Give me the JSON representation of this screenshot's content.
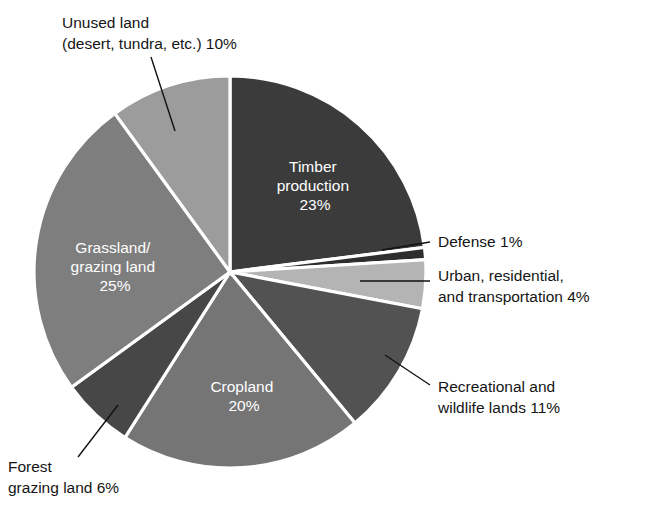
{
  "chart_data": {
    "type": "pie",
    "title": "",
    "subtitle": "",
    "xlabel": "",
    "ylabel": "",
    "legend_position": "none",
    "grid": false,
    "start_angle_deg": 0,
    "direction": "clockwise",
    "center": {
      "x": 230,
      "y": 272
    },
    "radius": 196,
    "categories": [
      "Timber production",
      "Defense",
      "Urban, residential, and transportation",
      "Recreational and wildlife lands",
      "Cropland",
      "Forest grazing land",
      "Grassland/grazing land",
      "Unused land (desert, tundra, etc.)"
    ],
    "values": [
      23,
      1,
      4,
      11,
      20,
      6,
      25,
      10
    ],
    "value_unit": "%",
    "slices": [
      {
        "key": "timber-production",
        "label_line1": "Timber",
        "label_line2": "production",
        "label_line3": "23%",
        "value": 23,
        "value_text": "23%",
        "color": "#3b3b3b",
        "label_placement": "inside",
        "label_x": 315,
        "label_y": 172
      },
      {
        "key": "defense",
        "label_line1": "Defense 1%",
        "label_line2": "",
        "label_line3": "",
        "value": 1,
        "value_text": "1%",
        "color": "#2e2e2e",
        "label_placement": "callout",
        "label_x": 438,
        "label_y": 247
      },
      {
        "key": "urban-residential-transportation",
        "label_line1": "Urban, residential,",
        "label_line2": "and transportation 4%",
        "label_line3": "",
        "value": 4,
        "value_text": "4%",
        "color": "#b4b4b4",
        "label_placement": "callout",
        "label_x": 438,
        "label_y": 281
      },
      {
        "key": "recreational-wildlife-lands",
        "label_line1": "Recreational and",
        "label_line2": "wildlife lands 11%",
        "label_line3": "",
        "value": 11,
        "value_text": "11%",
        "color": "#525252",
        "label_placement": "callout",
        "label_x": 438,
        "label_y": 392
      },
      {
        "key": "cropland",
        "label_line1": "Cropland",
        "label_line2": "20%",
        "label_line3": "",
        "value": 20,
        "value_text": "20%",
        "color": "#757575",
        "label_placement": "inside",
        "label_y": 392,
        "label_x": 244
      },
      {
        "key": "forest-grazing-land",
        "label_line1": "Forest",
        "label_line2": "grazing land 6%",
        "label_line3": "",
        "value": 6,
        "value_text": "6%",
        "color": "#474747",
        "label_placement": "callout",
        "label_x": 8,
        "label_y": 472
      },
      {
        "key": "grassland-grazing-land",
        "label_line1": "Grassland/",
        "label_line2": "grazing land",
        "label_line3": "25%",
        "value": 25,
        "value_text": "25%",
        "color": "#7e7e7e",
        "label_placement": "inside",
        "label_x": 115,
        "label_y": 253
      },
      {
        "key": "unused-land",
        "label_line1": "Unused land",
        "label_line2": "(desert, tundra, etc.) 10%",
        "label_line3": "",
        "value": 10,
        "value_text": "10%",
        "color": "#9c9c9c",
        "label_placement": "callout",
        "label_x": 62,
        "label_y": 28
      }
    ],
    "colors": {
      "background": "#ffffff",
      "slice_divider": "#ffffff",
      "leader_line": "#121212",
      "callout_text": "#151515",
      "inside_text": "#ffffff"
    }
  }
}
